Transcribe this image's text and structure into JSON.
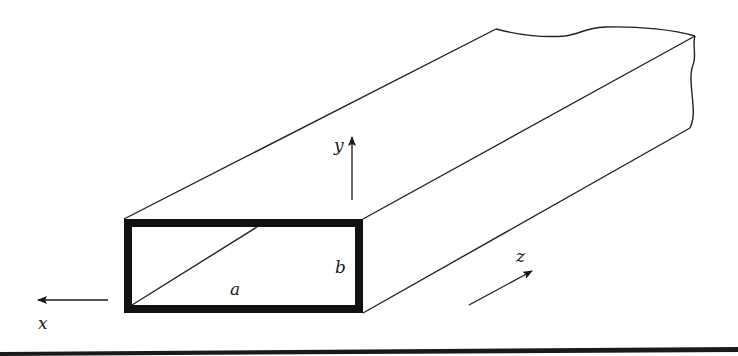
{
  "figure": {
    "labels": {
      "x_axis": "x",
      "y_axis": "y",
      "z_axis": "z",
      "width": "a",
      "height": "b"
    },
    "colors": {
      "stroke": "#222222",
      "wall": "#111111",
      "background": "#ffffff"
    }
  }
}
